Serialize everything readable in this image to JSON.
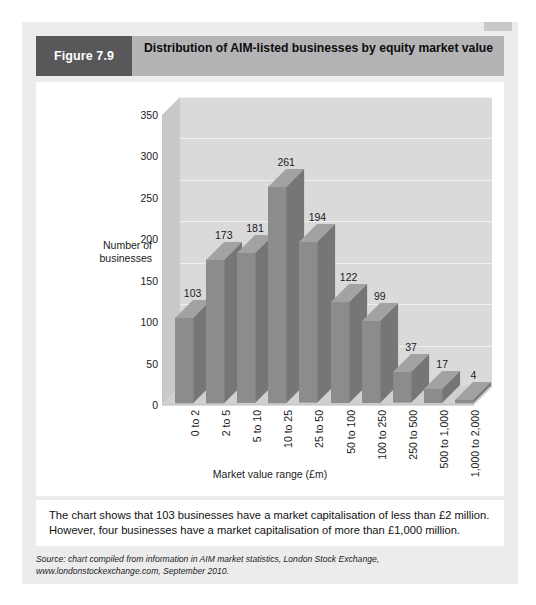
{
  "figure": {
    "badge": "Figure 7.9",
    "title": "Distribution of AIM-listed businesses by equity market value"
  },
  "caption": {
    "line1": "The chart shows that 103 businesses have a market capitalisation of less than £2 million.",
    "line2": "However, four businesses have a market capitalisation of more than £1,000 million."
  },
  "source": {
    "text": "Source: chart compiled from information in AIM market statistics, London Stock Exchange, www.londonstockexchange.com, September 2010."
  },
  "colors": {
    "badge_bg": "#58585a",
    "header_bg": "#b4b4b6",
    "card_bg": "#ececed",
    "panel_bg": "#ffffff",
    "wall_bg": "#dadada",
    "bar_front": "#8c8c8c",
    "bar_side": "#767676",
    "bar_top": "#a2a2a2",
    "gridline": "#efefef"
  },
  "chart_data": {
    "type": "bar",
    "title": "Distribution of AIM-listed businesses by equity market value",
    "xlabel": "Market value range (£m)",
    "ylabel": "Number of businesses",
    "categories": [
      "0 to 2",
      "2 to 5",
      "5 to 10",
      "10 to 25",
      "25 to 50",
      "50 to 100",
      "100 to 250",
      "250 to 500",
      "500 to 1,000",
      "1,000 to 2,000"
    ],
    "values": [
      103,
      173,
      181,
      261,
      194,
      122,
      99,
      37,
      17,
      4
    ],
    "ylim": [
      0,
      350
    ],
    "yticks": [
      0,
      50,
      100,
      150,
      200,
      250,
      300,
      350
    ],
    "ytick_labels": [
      "0",
      "50",
      "100",
      "150",
      "200",
      "250",
      "300",
      "350"
    ],
    "grid": true,
    "legend": "none",
    "style": "3d",
    "data_labels": [
      "103",
      "173",
      "181",
      "261",
      "194",
      "122",
      "99",
      "37",
      "17",
      "4"
    ]
  }
}
